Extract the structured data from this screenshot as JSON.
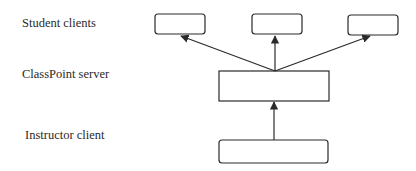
{
  "diagram": {
    "type": "architecture",
    "labels": {
      "students": "Student clients",
      "server": "ClassPoint server",
      "instructor": "Instructor client"
    },
    "nodes": [
      {
        "id": "student-1",
        "role": "Student client",
        "text": ""
      },
      {
        "id": "student-2",
        "role": "Student client",
        "text": ""
      },
      {
        "id": "student-3",
        "role": "Student client",
        "text": ""
      },
      {
        "id": "server",
        "role": "ClassPoint server",
        "text": ""
      },
      {
        "id": "instructor",
        "role": "Instructor client",
        "text": ""
      }
    ],
    "edges": [
      {
        "from": "instructor",
        "to": "server"
      },
      {
        "from": "server",
        "to": "student-1"
      },
      {
        "from": "server",
        "to": "student-2"
      },
      {
        "from": "server",
        "to": "student-3"
      }
    ],
    "colors": {
      "stroke": "#2a2a2a",
      "background": "#ffffff"
    }
  }
}
